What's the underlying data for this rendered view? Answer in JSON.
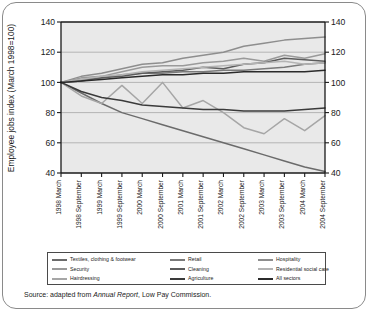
{
  "source": {
    "prefix": "Source: adapted from ",
    "italic": "Annual Report",
    "suffix": ", Low Pay Commission."
  },
  "legend": {
    "entries": [
      {
        "label": "Textiles, clothing & footwear",
        "color": "#6b6b6b",
        "row": 1,
        "col": 1
      },
      {
        "label": "Retail",
        "color": "#7a7a7a",
        "row": 1,
        "col": 2
      },
      {
        "label": "Hospitality",
        "color": "#8e8e8e",
        "row": 1,
        "col": 3
      },
      {
        "label": "Security",
        "color": "#9a9a9a",
        "row": 2,
        "col": 1
      },
      {
        "label": "Cleaning",
        "color": "#5c5c5c",
        "row": 2,
        "col": 2
      },
      {
        "label": "Residential social care",
        "color": "#b4b4b4",
        "row": 2,
        "col": 3
      },
      {
        "label": "Hairdressing",
        "color": "#a6a6a6",
        "row": 3,
        "col": 1
      },
      {
        "label": "Agriculture",
        "color": "#3a3a3a",
        "row": 3,
        "col": 2
      },
      {
        "label": "All sectors",
        "color": "#2b2b2b",
        "row": 3,
        "col": 3
      }
    ]
  },
  "chart_data": {
    "type": "line",
    "title": "",
    "xlabel": "",
    "ylabel": "Employee jobs index (March 1998=100)",
    "ylim": [
      40,
      140
    ],
    "yticks": [
      40,
      60,
      80,
      100,
      120,
      140
    ],
    "grid": true,
    "legend_position": "bottom",
    "dual_y_axis": true,
    "categories": [
      "1998 March",
      "1998 September",
      "1999 March",
      "1999 September",
      "2000 March",
      "2000 September",
      "2001 March",
      "2001 September",
      "2002 March",
      "2002 September",
      "2003 March",
      "2003 September",
      "2004 March",
      "2004 September"
    ],
    "series": [
      {
        "name": "Textiles, clothing & footwear",
        "color": "#6b6b6b",
        "values": [
          100,
          93,
          86,
          80,
          76,
          72,
          68,
          64,
          60,
          56,
          52,
          48,
          44,
          41
        ]
      },
      {
        "name": "Retail",
        "color": "#7a7a7a",
        "values": [
          100,
          102,
          103,
          105,
          106,
          106,
          107,
          107,
          108,
          108,
          109,
          110,
          112,
          113
        ]
      },
      {
        "name": "Hospitality",
        "color": "#8e8e8e",
        "values": [
          100,
          104,
          106,
          109,
          112,
          113,
          116,
          118,
          120,
          124,
          126,
          128,
          129,
          130
        ]
      },
      {
        "name": "Security",
        "color": "#9a9a9a",
        "values": [
          100,
          103,
          104,
          107,
          110,
          111,
          111,
          113,
          114,
          116,
          114,
          118,
          116,
          119
        ]
      },
      {
        "name": "Cleaning",
        "color": "#5c5c5c",
        "values": [
          100,
          101,
          103,
          104,
          106,
          107,
          108,
          110,
          109,
          112,
          113,
          116,
          115,
          114
        ]
      },
      {
        "name": "Residential social care",
        "color": "#b4b4b4",
        "values": [
          100,
          102,
          104,
          105,
          107,
          108,
          109,
          110,
          111,
          112,
          113,
          114,
          112,
          113
        ]
      },
      {
        "name": "Hairdressing",
        "color": "#a6a6a6",
        "values": [
          100,
          91,
          86,
          98,
          86,
          100,
          83,
          88,
          80,
          70,
          66,
          76,
          68,
          78
        ]
      },
      {
        "name": "Agriculture",
        "color": "#3a3a3a",
        "values": [
          100,
          94,
          90,
          88,
          85,
          84,
          83,
          82,
          82,
          81,
          81,
          81,
          82,
          83
        ]
      },
      {
        "name": "All sectors",
        "color": "#2b2b2b",
        "values": [
          100,
          101,
          102,
          103,
          104,
          105,
          105,
          106,
          106,
          107,
          107,
          107,
          107,
          108
        ]
      }
    ]
  }
}
